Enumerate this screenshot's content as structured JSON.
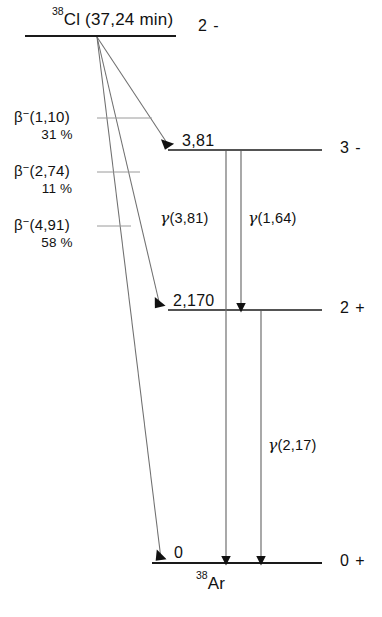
{
  "diagram": {
    "kind": "nuclear-decay-scheme",
    "parent": {
      "mass_number": "38",
      "element": "Cl",
      "half_life": "(37,24 min)",
      "spin_parity": "2 -"
    },
    "daughter": {
      "mass_number": "38",
      "element": "Ar"
    },
    "levels": [
      {
        "energy_label": "3,81",
        "spin_parity": "3 -"
      },
      {
        "energy_label": "2,170",
        "spin_parity": "2 +"
      },
      {
        "energy_label": "0",
        "spin_parity": "0 +"
      }
    ],
    "beta_branches": [
      {
        "name_prefix": "β",
        "name_sup": "−",
        "energy": "(1,10)",
        "intensity": "31 %"
      },
      {
        "name_prefix": "β",
        "name_sup": "−",
        "energy": "(2,74)",
        "intensity": "11 %"
      },
      {
        "name_prefix": "β",
        "name_sup": "−",
        "energy": "(4,91)",
        "intensity": "58 %"
      }
    ],
    "gamma_transitions": [
      {
        "symbol": "γ",
        "energy": "(3,81)"
      },
      {
        "symbol": "γ",
        "energy": "(1,64)"
      },
      {
        "symbol": "γ",
        "energy": "(2,17)"
      }
    ],
    "colors": {
      "ink": "#111111",
      "line": "#1a1a1a",
      "leader": "#8a8a8a",
      "background": "#ffffff"
    }
  }
}
